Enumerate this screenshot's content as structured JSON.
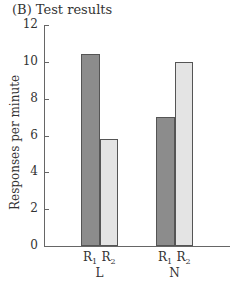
{
  "title": "(B) Test results",
  "chart_data": {
    "type": "bar",
    "title": "(B) Test results",
    "xlabel": "",
    "ylabel": "Responses per minute",
    "ylim": [
      0,
      12
    ],
    "yticks": [
      0,
      2,
      4,
      6,
      8,
      10,
      12
    ],
    "grid": false,
    "legend": "none",
    "categories": [
      "L",
      "N"
    ],
    "series": [
      {
        "name": "R1",
        "values": [
          10.4,
          7.0
        ],
        "color": "#8c8c8c"
      },
      {
        "name": "R2",
        "values": [
          5.8,
          10.0
        ],
        "color": "#e4e4e4"
      }
    ]
  },
  "axis": {
    "ylabel": "Responses per minute",
    "ticks": [
      "0",
      "2",
      "4",
      "6",
      "8",
      "10",
      "12"
    ]
  },
  "bars": {
    "sub_labels": [
      {
        "base": "R",
        "sub": "1"
      },
      {
        "base": "R",
        "sub": "2"
      }
    ],
    "groups": [
      "L",
      "N"
    ]
  }
}
